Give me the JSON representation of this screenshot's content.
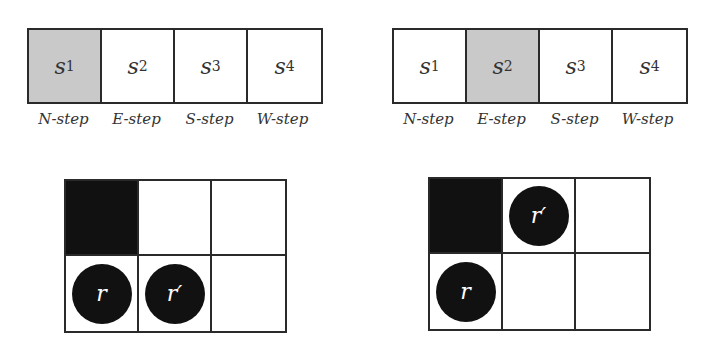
{
  "panels": [
    {
      "states": [
        {
          "name": "s",
          "sub": "1",
          "active": true
        },
        {
          "name": "s",
          "sub": "2",
          "active": false
        },
        {
          "name": "s",
          "sub": "3",
          "active": false
        },
        {
          "name": "s",
          "sub": "4",
          "active": false
        }
      ],
      "step_labels": [
        "N-step",
        "E-step",
        "S-step",
        "W-step"
      ],
      "grid": {
        "rows": 2,
        "cols": 3,
        "wall": [
          0,
          0
        ],
        "robots": [
          {
            "label": "r",
            "row": 1,
            "col": 0
          },
          {
            "label": "r′",
            "row": 1,
            "col": 1
          }
        ]
      }
    },
    {
      "states": [
        {
          "name": "s",
          "sub": "1",
          "active": false
        },
        {
          "name": "s",
          "sub": "2",
          "active": true
        },
        {
          "name": "s",
          "sub": "3",
          "active": false
        },
        {
          "name": "s",
          "sub": "4",
          "active": false
        }
      ],
      "step_labels": [
        "N-step",
        "E-step",
        "S-step",
        "W-step"
      ],
      "grid": {
        "rows": 2,
        "cols": 3,
        "wall": [
          0,
          0
        ],
        "robots": [
          {
            "label": "r",
            "row": 1,
            "col": 0
          },
          {
            "label": "r′",
            "row": 0,
            "col": 1
          }
        ]
      }
    }
  ],
  "colors": {
    "active_state": "#c9c9c9",
    "wall": "#111111",
    "robot": "#111111",
    "line": "#2a2a2a"
  }
}
